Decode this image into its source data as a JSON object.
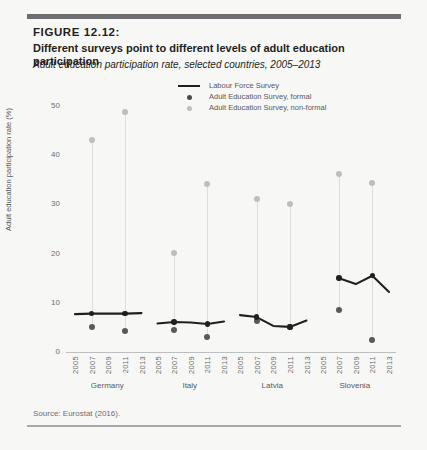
{
  "figure": {
    "number": "FIGURE 12.12:",
    "title": "Different surveys point to different levels of adult education participation",
    "subtitle": "Adult education participation rate, selected countries, 2005–2013",
    "source": "Source: Eurostat (2016)."
  },
  "legend": {
    "items": [
      {
        "label": "Labour Force Survey",
        "marker": "line",
        "color": "#231f20"
      },
      {
        "label": "Adult Education Survey, formal",
        "marker": "dot",
        "color": "#4a4a4c"
      },
      {
        "label": "Adult Education Survey, non-formal",
        "marker": "dot",
        "color": "#bcbec0"
      }
    ]
  },
  "chart_data": {
    "type": "line",
    "title": "Different surveys point to different levels of adult education participation",
    "subtitle": "Adult education participation rate, selected countries, 2005–2013",
    "xlabel": "",
    "ylabel": "Adult education participation rate (%)",
    "ylim": [
      0,
      52
    ],
    "yticks": [
      0,
      10,
      20,
      30,
      40,
      50
    ],
    "grid": false,
    "legend_position": "top-center",
    "panels": [
      {
        "country": "Germany",
        "x": [
          2005,
          2007,
          2009,
          2011,
          2013
        ],
        "series": [
          {
            "name": "Labour Force Survey",
            "type": "line",
            "values": [
              7.7,
              7.8,
              7.8,
              7.8,
              7.9
            ]
          },
          {
            "name": "Adult Education Survey, formal",
            "type": "scatter",
            "values": [
              null,
              5.0,
              null,
              4.2,
              null
            ]
          },
          {
            "name": "Adult Education Survey, non-formal",
            "type": "scatter",
            "values": [
              null,
              43.0,
              null,
              48.8,
              null
            ]
          }
        ]
      },
      {
        "country": "Italy",
        "x": [
          2005,
          2007,
          2009,
          2011,
          2013
        ],
        "series": [
          {
            "name": "Labour Force Survey",
            "type": "line",
            "values": [
              5.8,
              6.1,
              6.0,
              5.7,
              6.2
            ]
          },
          {
            "name": "Adult Education Survey, formal",
            "type": "scatter",
            "values": [
              null,
              4.4,
              null,
              3.0,
              null
            ]
          },
          {
            "name": "Adult Education Survey, non-formal",
            "type": "scatter",
            "values": [
              null,
              20.2,
              null,
              34.2,
              null
            ]
          }
        ]
      },
      {
        "country": "Latvia",
        "x": [
          2005,
          2007,
          2009,
          2011,
          2013
        ],
        "series": [
          {
            "name": "Labour Force Survey",
            "type": "line",
            "values": [
              7.5,
              7.1,
              5.3,
              5.1,
              6.4
            ]
          },
          {
            "name": "Adult Education Survey, formal",
            "type": "scatter",
            "values": [
              null,
              6.2,
              null,
              5.0,
              null
            ]
          },
          {
            "name": "Adult Education Survey, non-formal",
            "type": "scatter",
            "values": [
              null,
              31.0,
              null,
              30.0,
              null
            ]
          }
        ]
      },
      {
        "country": "Slovenia",
        "x": [
          2005,
          2007,
          2009,
          2011,
          2013
        ],
        "series": [
          {
            "name": "Labour Force Survey",
            "type": "line",
            "values": [
              null,
              15.0,
              13.8,
              15.5,
              12.2
            ]
          },
          {
            "name": "Adult Education Survey, formal",
            "type": "scatter",
            "values": [
              null,
              8.6,
              null,
              2.4,
              null
            ]
          },
          {
            "name": "Adult Education Survey, non-formal",
            "type": "scatter",
            "values": [
              null,
              36.2,
              null,
              34.4,
              null
            ]
          }
        ]
      }
    ]
  }
}
